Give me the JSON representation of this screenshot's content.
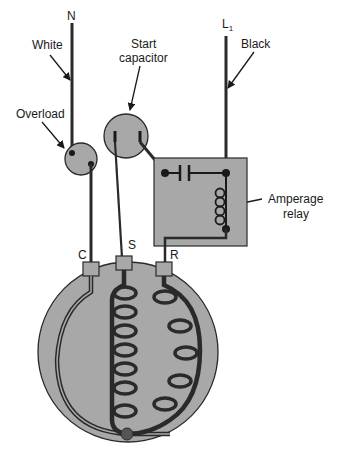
{
  "diagram": {
    "labels": {
      "neutral": "N",
      "line": "L",
      "line_sub": "1",
      "white": "White",
      "black": "Black",
      "overload": "Overload",
      "start_cap_line1": "Start",
      "start_cap_line2": "capacitor",
      "relay_line1": "Amperage",
      "relay_line2": "relay",
      "terminal_c": "C",
      "terminal_s": "S",
      "terminal_r": "R"
    },
    "colors": {
      "component_fill": "#a8a8a8",
      "wire": "#2a2a2a",
      "background": "#ffffff"
    }
  }
}
